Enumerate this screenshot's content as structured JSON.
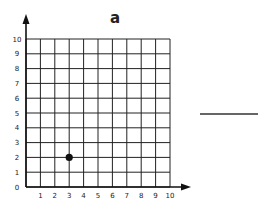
{
  "title": "a",
  "answer_blank": "",
  "chart_data": {
    "type": "scatter",
    "title": "a",
    "xlabel": "",
    "ylabel": "",
    "xlim": [
      0,
      10
    ],
    "ylim": [
      0,
      10
    ],
    "grid": true,
    "x_ticks": [
      "1",
      "2",
      "3",
      "4",
      "5",
      "6",
      "7",
      "8",
      "9",
      "10"
    ],
    "y_ticks": [
      "0",
      "1",
      "2",
      "3",
      "4",
      "5",
      "6",
      "7",
      "8",
      "9",
      "10"
    ],
    "points": [
      {
        "x": 3,
        "y": 2
      }
    ],
    "colors": {
      "grid": "#222222",
      "point": "#111111"
    }
  }
}
